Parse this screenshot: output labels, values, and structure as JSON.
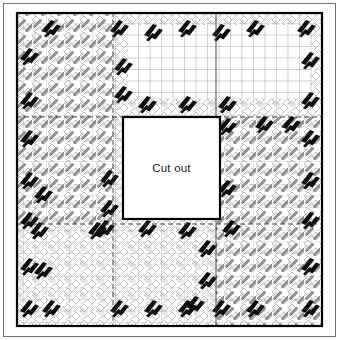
{
  "figure": {
    "type": "sewing-pattern-layout",
    "title": "",
    "canvas": {
      "width": 339,
      "height": 340,
      "background": "#ffffff"
    }
  },
  "labels": {
    "cutout": "Cut out"
  },
  "colors": {
    "outline": "#000000",
    "frame_thin": "#555555",
    "seam": "#222222",
    "grid_line": "#b9b9b9",
    "grid_line_dark": "#8d8d8d",
    "houndstooth_light": "#c9c9c9",
    "houndstooth_mid": "#8f8f8f",
    "houndstooth_dark": "#1a1a1a",
    "paper": "#ffffff"
  },
  "outer_frame": {
    "x": 3,
    "y": 3,
    "width": 333,
    "height": 334,
    "stroke": "#6b6b6b",
    "stroke_width": 1
  },
  "panel_border": {
    "x": 16,
    "y": 12,
    "width": 307,
    "height": 315,
    "stroke": "#000000",
    "stroke_width": 2.2
  },
  "cutout": {
    "x": 123,
    "y": 117,
    "width": 97,
    "height": 102,
    "stroke": "#000000",
    "stroke_width": 2.2,
    "fill": "#ffffff",
    "label": "Cut out"
  },
  "seams": {
    "description": "Panel division lines splitting the square into a 3x3 arrangement",
    "vertical": [
      {
        "x": 113,
        "y1": 12,
        "y2": 327,
        "style": "dashed"
      },
      {
        "x": 216,
        "y1": 12,
        "y2": 327,
        "style": "solid"
      }
    ],
    "horizontal": [
      {
        "y": 117,
        "x1": 16,
        "x2": 323,
        "style": "dashed"
      },
      {
        "y": 224,
        "x1": 16,
        "x2": 323,
        "style": "dashed"
      }
    ]
  },
  "plain_grid_region": {
    "description": "Un-patterned graph-paper area in the upper centre-right",
    "x": 128,
    "y": 25,
    "width": 183,
    "height": 73,
    "cell_size": 11.5
  },
  "grid": {
    "cell_size": 11.5,
    "visible": true
  },
  "pattern_regions": [
    {
      "name": "top-left-block",
      "x": 16,
      "y": 12,
      "width": 97,
      "height": 105,
      "density": "dense"
    },
    {
      "name": "top-centre-block",
      "x": 113,
      "y": 12,
      "width": 103,
      "height": 105,
      "density": "sparse"
    },
    {
      "name": "top-right-block",
      "x": 216,
      "y": 12,
      "width": 107,
      "height": 105,
      "density": "sparse"
    },
    {
      "name": "middle-left-block",
      "x": 16,
      "y": 117,
      "width": 97,
      "height": 107,
      "density": "dense"
    },
    {
      "name": "middle-right-block",
      "x": 216,
      "y": 117,
      "width": 107,
      "height": 107,
      "density": "dense"
    },
    {
      "name": "bottom-left-block",
      "x": 16,
      "y": 224,
      "width": 97,
      "height": 103,
      "density": "sparse"
    },
    {
      "name": "bottom-centre-block",
      "x": 113,
      "y": 224,
      "width": 103,
      "height": 103,
      "density": "sparse"
    },
    {
      "name": "bottom-right-block",
      "x": 216,
      "y": 224,
      "width": 107,
      "height": 103,
      "density": "dense"
    }
  ],
  "accent_marks": {
    "description": "Bold black double-slash motifs scattered along borders and seams",
    "fill": "#0d0d0d",
    "count": 46
  }
}
